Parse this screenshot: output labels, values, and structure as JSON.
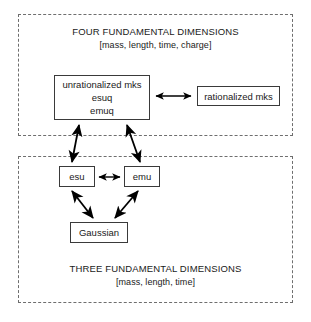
{
  "diagram": {
    "regions": [
      {
        "id": "four",
        "heading": "FOUR FUNDAMENTAL DIMENSIONS",
        "subheading": "[mass, length, time, charge]"
      },
      {
        "id": "three",
        "heading": "THREE FUNDAMENTAL DIMENSIONS",
        "subheading": "[mass, length, time]"
      }
    ],
    "nodes": {
      "unrationalized_mks": {
        "line1": "unrationalized mks",
        "line2": "esuq",
        "line3": "emuq"
      },
      "rationalized_mks": {
        "label": "rationalized mks"
      },
      "esu": {
        "label": "esu"
      },
      "emu": {
        "label": "emu"
      },
      "gaussian": {
        "label": "Gaussian"
      }
    },
    "edges": [
      {
        "id": "mks-to-rationalized",
        "from": "unrationalized_mks",
        "to": "rationalized_mks",
        "arrowheads": "both",
        "orientation": "horizontal"
      },
      {
        "id": "esu-to-mks",
        "from": "esu",
        "to": "unrationalized_mks",
        "arrowheads": "both",
        "orientation": "diagonal"
      },
      {
        "id": "emu-to-mks",
        "from": "emu",
        "to": "unrationalized_mks",
        "arrowheads": "both",
        "orientation": "diagonal"
      },
      {
        "id": "esu-to-emu",
        "from": "esu",
        "to": "emu",
        "arrowheads": "both",
        "orientation": "horizontal"
      },
      {
        "id": "esu-to-gaussian",
        "from": "esu",
        "to": "gaussian",
        "arrowheads": "both",
        "orientation": "diagonal"
      },
      {
        "id": "emu-to-gaussian",
        "from": "emu",
        "to": "gaussian",
        "arrowheads": "both",
        "orientation": "diagonal"
      }
    ],
    "colors": {
      "background": "#ffffff",
      "text": "#1a1a1a",
      "node_border": "#3a3a3a",
      "region_border": "#6e6e6e",
      "arrow": "#000000"
    }
  }
}
